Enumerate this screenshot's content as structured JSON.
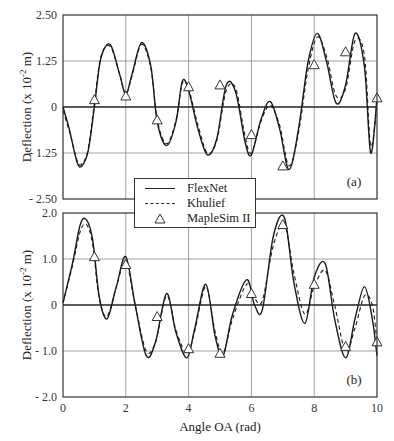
{
  "figure": {
    "xlabel": "Angle OA (rad)",
    "ylabel_a": "Deflection (x 10-2 m)",
    "ylabel_b": "Deflection (x 10-2 m)",
    "panel_a_label": "(a)",
    "panel_b_label": "(b)",
    "legend": [
      {
        "label": "FlexNet",
        "style": "solid"
      },
      {
        "label": "Khulief",
        "style": "dashed"
      },
      {
        "label": "MapleSim II",
        "style": "triangle"
      }
    ]
  },
  "chart_data": [
    {
      "type": "line",
      "panel": "(a)",
      "title": "",
      "xlabel": "",
      "ylabel": "Deflection (x 10^-2 m)",
      "xlim": [
        0,
        10
      ],
      "ylim": [
        -2.5,
        2.5
      ],
      "xticks": [
        0,
        2,
        4,
        6,
        8,
        10
      ],
      "yticks": [
        -2.5,
        -1.25,
        0,
        1.25,
        2.5
      ],
      "ytick_labels": [
        "- 2.50",
        "- 1.25",
        "0",
        "1.25",
        "2.50"
      ],
      "grid": true,
      "legend_position": "lower center",
      "series": [
        {
          "name": "FlexNet",
          "style": "solid",
          "x": [
            0,
            0.2,
            0.45,
            0.6,
            0.8,
            1.0,
            1.2,
            1.5,
            1.8,
            2.0,
            2.2,
            2.5,
            2.8,
            3.0,
            3.3,
            3.6,
            3.8,
            4.0,
            4.3,
            4.6,
            4.9,
            5.2,
            5.5,
            5.8,
            6.0,
            6.3,
            6.6,
            6.9,
            7.2,
            7.5,
            7.8,
            8.1,
            8.4,
            8.7,
            9.0,
            9.3,
            9.6,
            9.8,
            10.0
          ],
          "y": [
            0,
            -0.6,
            -1.5,
            -1.6,
            -1.2,
            0.0,
            1.3,
            1.7,
            0.9,
            0.35,
            0.9,
            1.75,
            1.1,
            -0.4,
            -1.05,
            -0.4,
            0.7,
            0.45,
            -0.6,
            -1.3,
            -0.85,
            0.6,
            0.4,
            -0.95,
            -1.3,
            -0.35,
            0.15,
            -0.6,
            -1.7,
            -0.6,
            1.2,
            2.0,
            1.2,
            0.1,
            0.6,
            2.0,
            1.1,
            -1.25,
            0.25
          ]
        },
        {
          "name": "Khulief",
          "style": "dashed",
          "x": [
            0,
            0.2,
            0.45,
            0.6,
            0.8,
            1.0,
            1.2,
            1.5,
            1.8,
            2.0,
            2.2,
            2.5,
            2.8,
            3.0,
            3.3,
            3.6,
            3.8,
            4.0,
            4.3,
            4.6,
            4.9,
            5.2,
            5.5,
            5.8,
            6.0,
            6.3,
            6.6,
            6.9,
            7.2,
            7.5,
            7.8,
            8.1,
            8.4,
            8.7,
            9.0,
            9.3,
            9.6,
            9.8,
            10.0
          ],
          "y": [
            -0.1,
            -0.65,
            -1.45,
            -1.55,
            -1.15,
            0.1,
            1.35,
            1.65,
            0.9,
            0.35,
            0.85,
            1.7,
            1.05,
            -0.35,
            -1.0,
            -0.35,
            0.65,
            0.5,
            -0.5,
            -1.25,
            -0.9,
            0.45,
            0.5,
            -0.8,
            -1.25,
            -0.4,
            0.05,
            -0.5,
            -1.6,
            -0.7,
            1.0,
            1.9,
            1.35,
            0.3,
            0.5,
            1.8,
            1.4,
            -1.05,
            0.1
          ]
        },
        {
          "name": "MapleSim II",
          "style": "triangle",
          "x": [
            1,
            2,
            3,
            4,
            5,
            6,
            7,
            8,
            9,
            10
          ],
          "y": [
            0.2,
            0.3,
            -0.35,
            0.55,
            0.6,
            -0.75,
            -1.6,
            1.15,
            1.5,
            0.25
          ]
        }
      ]
    },
    {
      "type": "line",
      "panel": "(b)",
      "title": "",
      "xlabel": "Angle OA (rad)",
      "ylabel": "Deflection (x 10^-2 m)",
      "xlim": [
        0,
        10
      ],
      "ylim": [
        -2.0,
        2.0
      ],
      "xticks": [
        0,
        2,
        4,
        6,
        8,
        10
      ],
      "yticks": [
        -2.0,
        -1.0,
        0,
        1.0,
        2.0
      ],
      "ytick_labels": [
        "- 2.0",
        "- 1.0",
        "0",
        "1.0",
        "2.0"
      ],
      "grid": true,
      "series": [
        {
          "name": "FlexNet",
          "style": "solid",
          "x": [
            0,
            0.3,
            0.55,
            0.75,
            0.95,
            1.15,
            1.4,
            1.7,
            2.0,
            2.3,
            2.65,
            2.95,
            3.3,
            3.6,
            3.95,
            4.2,
            4.55,
            4.85,
            5.1,
            5.4,
            5.85,
            6.1,
            6.35,
            6.7,
            7.05,
            7.35,
            7.7,
            8.0,
            8.35,
            8.65,
            9.0,
            9.3,
            9.6,
            9.85,
            10.0
          ],
          "y": [
            0.05,
            0.9,
            1.75,
            1.85,
            1.4,
            0.2,
            -0.3,
            0.4,
            1.05,
            0.0,
            -1.1,
            -0.8,
            0.25,
            -0.6,
            -1.15,
            -0.5,
            0.45,
            -0.7,
            -1.1,
            -0.2,
            0.55,
            0.0,
            -0.1,
            1.5,
            1.9,
            0.5,
            -0.4,
            0.6,
            0.9,
            -0.3,
            -1.15,
            -0.3,
            0.4,
            -0.3,
            -1.1
          ]
        },
        {
          "name": "Khulief",
          "style": "dashed",
          "x": [
            0,
            0.3,
            0.55,
            0.75,
            0.95,
            1.15,
            1.4,
            1.7,
            2.0,
            2.3,
            2.65,
            2.95,
            3.3,
            3.6,
            3.95,
            4.2,
            4.55,
            4.85,
            5.1,
            5.4,
            5.85,
            6.1,
            6.35,
            6.7,
            7.05,
            7.35,
            7.7,
            8.0,
            8.35,
            8.65,
            9.0,
            9.3,
            9.6,
            9.85,
            10.0
          ],
          "y": [
            0.05,
            0.85,
            1.6,
            1.75,
            1.3,
            0.15,
            -0.25,
            0.4,
            0.95,
            0.0,
            -1.0,
            -0.8,
            0.2,
            -0.55,
            -1.05,
            -0.55,
            0.4,
            -0.6,
            -1.05,
            -0.3,
            0.45,
            0.15,
            0.1,
            1.3,
            1.75,
            0.7,
            -0.2,
            0.4,
            0.75,
            0.0,
            -1.0,
            -0.5,
            0.2,
            0.0,
            -0.8
          ]
        },
        {
          "name": "MapleSim II",
          "style": "triangle",
          "x": [
            1,
            2,
            3,
            4,
            5,
            6,
            7,
            8,
            9,
            10
          ],
          "y": [
            1.05,
            0.88,
            -0.25,
            -0.95,
            -1.05,
            0.25,
            1.75,
            0.45,
            -0.9,
            -0.8
          ]
        }
      ]
    }
  ]
}
